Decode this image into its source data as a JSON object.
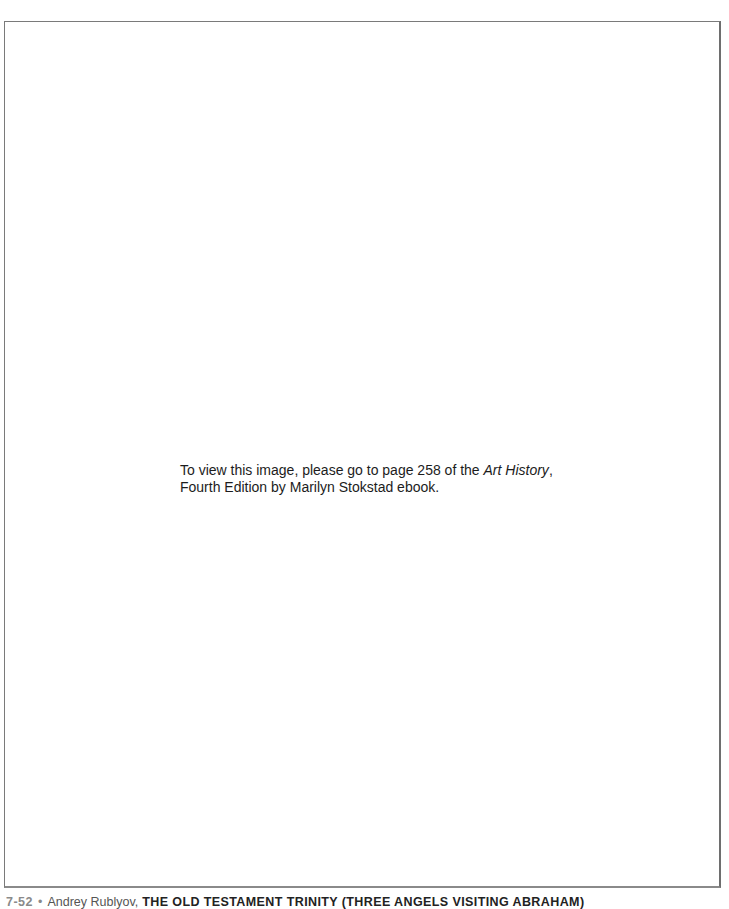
{
  "figure_frame": {
    "notice": {
      "line1_prefix": "To view this image, please go to page 258 of the ",
      "book_title": "Art History",
      "line1_suffix": ",",
      "line2": "Fourth Edition by Marilyn Stokstad ebook."
    }
  },
  "caption": {
    "figure_number": "7-52",
    "bullet": "•",
    "artist": "Andrey Rublyov,",
    "title": "THE OLD TESTAMENT TRINITY (THREE ANGELS VISITING ABRAHAM)"
  }
}
